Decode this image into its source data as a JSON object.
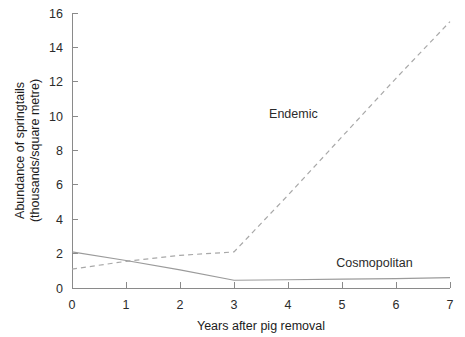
{
  "chart_data": {
    "type": "line",
    "title": "",
    "xlabel": "Years after pig removal",
    "ylabel": "Abundance of springtails\n(thousands/square metre)",
    "ylabel_line1": "Abundance of springtails",
    "ylabel_line2": "(thousands/square metre)",
    "xlim": [
      0,
      7
    ],
    "ylim": [
      0,
      16
    ],
    "xticks": [
      "0",
      "1",
      "2",
      "3",
      "4",
      "5",
      "6",
      "7"
    ],
    "yticks": [
      "0",
      "2",
      "4",
      "6",
      "8",
      "10",
      "12",
      "14",
      "16"
    ],
    "grid": false,
    "legend_position": "inline-annotations",
    "x": [
      0,
      1,
      2,
      3,
      4,
      5,
      6,
      7
    ],
    "series": [
      {
        "name": "Endemic",
        "style": "dashed",
        "color": "#a8a8a8",
        "label_x": 4.1,
        "label_y": 9.9,
        "values": [
          1.1,
          1.55,
          1.9,
          2.1,
          5.4,
          8.8,
          12.2,
          15.5
        ]
      },
      {
        "name": "Cosmopolitan",
        "style": "solid",
        "color": "#9b9b9b",
        "label_x": 5.6,
        "label_y": 1.25,
        "values": [
          2.1,
          1.6,
          1.05,
          0.45,
          0.48,
          0.52,
          0.55,
          0.6
        ]
      }
    ]
  }
}
